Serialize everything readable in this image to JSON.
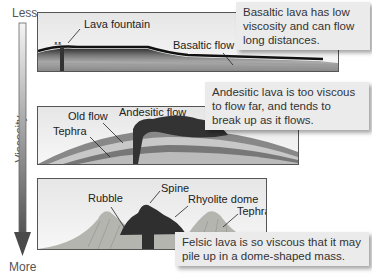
{
  "axis": {
    "top_label": "Less",
    "bottom_label": "More",
    "title": "Viscosity"
  },
  "panels": [
    {
      "id": "basaltic",
      "labels": {
        "fountain": "Lava fountain",
        "flow": "Basaltic flow"
      },
      "callout": "Basaltic lava has low viscosity and can flow long distances."
    },
    {
      "id": "andesitic",
      "labels": {
        "old_flow": "Old flow",
        "tephra": "Tephra",
        "flow": "Andesitic flow"
      },
      "callout": "Andesitic lava is too viscous to flow far, and tends to break up as it flows."
    },
    {
      "id": "felsic",
      "labels": {
        "spine": "Spine",
        "rubble": "Rubble",
        "dome": "Rhyolite dome",
        "tephra": "Tephra"
      },
      "callout": "Felsic lava is so viscous that it may pile up in a dome-shaped mass."
    }
  ]
}
